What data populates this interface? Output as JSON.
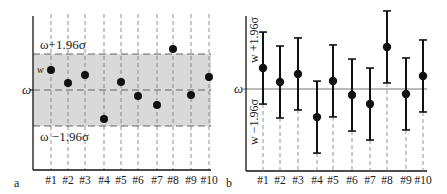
{
  "chart_data": [
    {
      "panel": "a",
      "type": "scatter",
      "categories": [
        "#1",
        "#2",
        "#3",
        "#4",
        "#5",
        "#6",
        "#7",
        "#8",
        "#9",
        "#10"
      ],
      "values_sigma": [
        1.09,
        0.38,
        0.82,
        -1.58,
        0.44,
        -0.33,
        -0.82,
        2.23,
        -0.27,
        0.71
      ],
      "reference_line": {
        "label": "ω",
        "value": 0
      },
      "band": {
        "upper_label": "ω+1.96σ",
        "lower_label": "ω −1.96σ",
        "upper": 1.96,
        "lower": -1.96,
        "color": "#d9d9d9"
      },
      "point_label": "w",
      "xlabel": "",
      "ylabel": "",
      "grid": "vertical dashed per category"
    },
    {
      "panel": "b",
      "type": "scatter",
      "categories": [
        "#1",
        "#2",
        "#3",
        "#4",
        "#5",
        "#6",
        "#7",
        "#8",
        "#9",
        "#10"
      ],
      "values_sigma": [
        1.14,
        0.38,
        0.82,
        -1.53,
        0.44,
        -0.33,
        -0.82,
        2.29,
        -0.27,
        0.71
      ],
      "error_bars": {
        "half_width_sigma": 1.96,
        "upper_label": "w +1.96σ",
        "lower_label": "w −1.96σ"
      },
      "reference_line": {
        "label": "ω",
        "value": 0
      },
      "xlabel": "",
      "ylabel": ""
    }
  ],
  "panels": {
    "a": {
      "letter": "a",
      "omega": "ω",
      "w": "w",
      "upper": "ω+1.96σ",
      "lower": "ω −1.96σ"
    },
    "b": {
      "letter": "b",
      "omega": "ω",
      "upper": "w +1.96σ",
      "lower": "w −1.96σ"
    }
  },
  "colors": {
    "band": "#d9d9d9",
    "ink": "#111111",
    "dash": "#777777"
  }
}
